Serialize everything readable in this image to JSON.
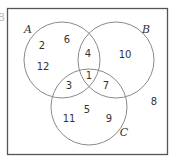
{
  "diagram": {
    "type": "venn-3-set",
    "edge_label": "B",
    "sets": [
      {
        "name": "A",
        "label": "A"
      },
      {
        "name": "B",
        "label": "B"
      },
      {
        "name": "C",
        "label": "C"
      }
    ],
    "regions": {
      "A_only": [
        "2",
        "6",
        "12"
      ],
      "B_only": [
        "10"
      ],
      "C_only": [
        "11",
        "5",
        "9"
      ],
      "A_and_B_only": [
        "4"
      ],
      "A_and_C_only": [
        "3"
      ],
      "B_and_C_only": [
        "7"
      ],
      "A_and_B_and_C": [
        "1"
      ],
      "outside": [
        "8"
      ]
    },
    "colors": {
      "frame": "#555555",
      "circle": "#8a8a8a",
      "text": "#333333"
    }
  }
}
